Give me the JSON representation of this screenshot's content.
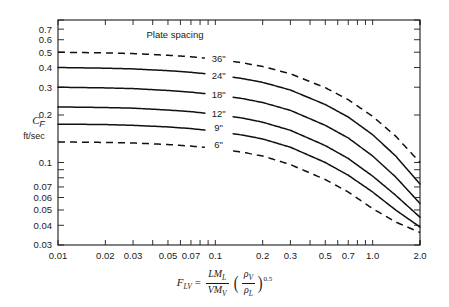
{
  "chart_data": {
    "type": "line",
    "title": "",
    "annotation": "Plate spacing",
    "xlabel": "F_LV = (L M_L)/(V M_V) (rho_V/rho_L)^0.5",
    "ylabel": "C_F",
    "ylabel_units": "ft/sec",
    "xscale": "log",
    "yscale": "log",
    "xlim": [
      0.01,
      2.0
    ],
    "ylim": [
      0.03,
      0.8
    ],
    "grid": false,
    "legend_position": "inline-labels",
    "xticks": [
      "0.01",
      "0.02",
      "0.03",
      "0.05",
      "0.07",
      "0.1",
      "0.2",
      "0.3",
      "0.5",
      "0.7",
      "1.0",
      "2.0"
    ],
    "xtick_values": [
      0.01,
      0.02,
      0.03,
      0.05,
      0.07,
      0.1,
      0.2,
      0.3,
      0.5,
      0.7,
      1.0,
      2.0
    ],
    "yticks": [
      "0.7",
      "0.6",
      "0.5",
      "0.4",
      "0.3",
      "0.2",
      "0.1",
      "0.07",
      "0.06",
      "0.05",
      "0.04",
      "0.03"
    ],
    "ytick_values": [
      0.7,
      0.6,
      0.5,
      0.4,
      0.3,
      0.2,
      0.1,
      0.07,
      0.06,
      0.05,
      0.04,
      0.03
    ],
    "series": [
      {
        "name": "36\"",
        "style": "dashed",
        "label_x": 0.105,
        "label_y": 0.455,
        "x": [
          0.01,
          0.02,
          0.03,
          0.05,
          0.07,
          0.1,
          0.15,
          0.2,
          0.3,
          0.5,
          0.7,
          1.0,
          1.4,
          2.0
        ],
        "y": [
          0.5,
          0.495,
          0.49,
          0.478,
          0.468,
          0.452,
          0.428,
          0.406,
          0.365,
          0.298,
          0.25,
          0.196,
          0.147,
          0.1
        ]
      },
      {
        "name": "24\"",
        "style": "solid",
        "label_x": 0.105,
        "label_y": 0.355,
        "x": [
          0.01,
          0.02,
          0.03,
          0.05,
          0.07,
          0.1,
          0.15,
          0.2,
          0.3,
          0.5,
          0.7,
          1.0,
          1.4,
          2.0
        ],
        "y": [
          0.4,
          0.396,
          0.392,
          0.382,
          0.373,
          0.36,
          0.34,
          0.322,
          0.288,
          0.233,
          0.194,
          0.15,
          0.11,
          0.073
        ]
      },
      {
        "name": "18\"",
        "style": "solid",
        "label_x": 0.105,
        "label_y": 0.268,
        "x": [
          0.01,
          0.02,
          0.03,
          0.05,
          0.07,
          0.1,
          0.15,
          0.2,
          0.3,
          0.5,
          0.7,
          1.0,
          1.4,
          2.0
        ],
        "y": [
          0.3,
          0.297,
          0.294,
          0.286,
          0.279,
          0.269,
          0.254,
          0.24,
          0.214,
          0.172,
          0.143,
          0.11,
          0.081,
          0.055
        ]
      },
      {
        "name": "12\"",
        "style": "solid",
        "label_x": 0.105,
        "label_y": 0.205,
        "x": [
          0.01,
          0.02,
          0.03,
          0.05,
          0.07,
          0.1,
          0.15,
          0.2,
          0.3,
          0.5,
          0.7,
          1.0,
          1.4,
          2.0
        ],
        "y": [
          0.225,
          0.223,
          0.221,
          0.215,
          0.21,
          0.202,
          0.191,
          0.18,
          0.16,
          0.128,
          0.106,
          0.082,
          0.062,
          0.045
        ]
      },
      {
        "name": "9\"",
        "style": "solid",
        "label_x": 0.105,
        "label_y": 0.166,
        "x": [
          0.01,
          0.02,
          0.03,
          0.05,
          0.07,
          0.1,
          0.15,
          0.2,
          0.3,
          0.5,
          0.7,
          1.0,
          1.4,
          2.0
        ],
        "y": [
          0.175,
          0.174,
          0.172,
          0.168,
          0.164,
          0.158,
          0.149,
          0.141,
          0.125,
          0.1,
          0.083,
          0.065,
          0.05,
          0.039
        ]
      },
      {
        "name": "6\"",
        "style": "dashed",
        "label_x": 0.105,
        "label_y": 0.129,
        "x": [
          0.01,
          0.02,
          0.03,
          0.05,
          0.07,
          0.1,
          0.15,
          0.2,
          0.3,
          0.5,
          0.7,
          1.0,
          1.4,
          2.0
        ],
        "y": [
          0.135,
          0.134,
          0.133,
          0.13,
          0.127,
          0.123,
          0.116,
          0.11,
          0.097,
          0.078,
          0.065,
          0.051,
          0.042,
          0.036
        ]
      }
    ]
  },
  "formula": {
    "lhs": "F",
    "lhs_sub": "LV",
    "equals": "=",
    "num_1": "L",
    "num_2": "M",
    "num_2_sub": "L",
    "den_1": "V",
    "den_2": "M",
    "den_2_sub": "V",
    "inner_num": "ρ",
    "inner_num_sub": "V",
    "inner_den": "ρ",
    "inner_den_sub": "L",
    "exponent": "0.5"
  },
  "colors": {
    "curve": "#111111",
    "axis": "#1a1a1a",
    "background": "#ffffff"
  }
}
